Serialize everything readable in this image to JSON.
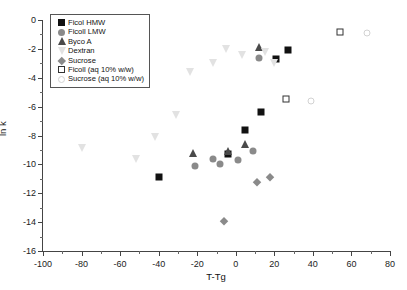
{
  "chart_data": {
    "type": "scatter",
    "title": "",
    "xlabel": "T-Tg",
    "ylabel": "ln k",
    "xlim": [
      -100,
      80
    ],
    "ylim": [
      -16,
      0
    ],
    "xticks": [
      -100,
      -80,
      -60,
      -40,
      -20,
      0,
      20,
      40,
      60,
      80
    ],
    "yticks": [
      0,
      -2,
      -4,
      -6,
      -8,
      -10,
      -12,
      -14,
      -16
    ],
    "grid": false,
    "legend_position": "top-left",
    "series": [
      {
        "name": "Ficol HMW",
        "marker": "filled-square",
        "color": "#111111",
        "points": [
          {
            "x": -40,
            "y": -10.9
          },
          {
            "x": -4,
            "y": -9.3
          },
          {
            "x": 5,
            "y": -7.6
          },
          {
            "x": 13,
            "y": -6.4
          },
          {
            "x": 21,
            "y": -2.7
          },
          {
            "x": 27,
            "y": -2.1
          }
        ]
      },
      {
        "name": "Ficoll LMW",
        "marker": "filled-circle",
        "color": "#8a8a8a",
        "points": [
          {
            "x": -21,
            "y": -10.1
          },
          {
            "x": -12,
            "y": -9.6
          },
          {
            "x": -8,
            "y": -10.0
          },
          {
            "x": 1,
            "y": -9.7
          },
          {
            "x": 9,
            "y": -9.1
          },
          {
            "x": 12,
            "y": -2.6
          }
        ]
      },
      {
        "name": "Byco A",
        "marker": "filled-triangle-up",
        "color": "#4a4a4a",
        "points": [
          {
            "x": -22,
            "y": -9.2
          },
          {
            "x": -4,
            "y": -9.1
          },
          {
            "x": 5,
            "y": -8.6
          },
          {
            "x": 12,
            "y": -1.9
          }
        ]
      },
      {
        "name": "Dextran",
        "marker": "filled-triangle-down",
        "color": "#e2e2e2",
        "points": [
          {
            "x": -80,
            "y": -8.9
          },
          {
            "x": -52,
            "y": -9.6
          },
          {
            "x": -42,
            "y": -8.1
          },
          {
            "x": -31,
            "y": -6.6
          },
          {
            "x": -24,
            "y": -3.6
          },
          {
            "x": -12,
            "y": -3.0
          },
          {
            "x": -5,
            "y": -2.0
          },
          {
            "x": 3,
            "y": -2.4
          },
          {
            "x": 15,
            "y": -2.2
          },
          {
            "x": 20,
            "y": -3.0
          }
        ]
      },
      {
        "name": "Sucrose",
        "marker": "filled-diamond",
        "color": "#8a8a8a",
        "points": [
          {
            "x": -6,
            "y": -13.9
          },
          {
            "x": 11,
            "y": -11.2
          },
          {
            "x": 18,
            "y": -10.9
          }
        ]
      },
      {
        "name": "Ficoll (aq 10% w/w)",
        "marker": "open-square",
        "color": "#333333",
        "points": [
          {
            "x": 26,
            "y": -5.5
          },
          {
            "x": 54,
            "y": -0.8
          }
        ]
      },
      {
        "name": "Sucrose (aq 10% w/w)",
        "marker": "open-circle",
        "color": "#d2d2d2",
        "points": [
          {
            "x": 39,
            "y": -5.6
          },
          {
            "x": 68,
            "y": -0.9
          }
        ]
      }
    ]
  }
}
